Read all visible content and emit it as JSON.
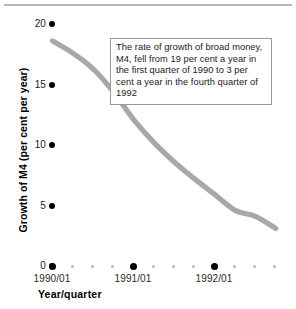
{
  "chart_data": {
    "type": "line",
    "title": "",
    "xlabel": "Year/quarter",
    "ylabel": "Growth of M4 (per cent per year)",
    "ylim": [
      0,
      20
    ],
    "yticks": [
      0,
      5,
      10,
      15,
      20
    ],
    "ytick_labels": [
      "0",
      "5",
      "10",
      "15",
      "20"
    ],
    "xlim_quarters": [
      "1990/01",
      "1992/04"
    ],
    "xtick_labels": [
      "1990/01",
      "1991/01",
      "1992/01"
    ],
    "grid": false,
    "legend": false,
    "series": [
      {
        "name": "Growth of M4",
        "color": "#a8a8a8",
        "x": [
          "1990/01",
          "1990/02",
          "1990/03",
          "1990/04",
          "1991/01",
          "1991/02",
          "1991/03",
          "1991/04",
          "1992/01",
          "1992/02",
          "1992/03",
          "1992/04"
        ],
        "values": [
          18.6,
          17.6,
          16.3,
          14.4,
          12.1,
          10.2,
          8.6,
          7.2,
          5.9,
          4.6,
          4.1,
          3.1
        ]
      }
    ],
    "annotations": [
      {
        "name": "callout",
        "text": "The rate of growth of broad money, M4, fell from 19 per cent a year in the first quarter of 1990 to 3 per cent a year in the fourth quarter of 1992"
      }
    ]
  },
  "axes": {
    "y_title": "Growth of M4 (per cent per year)",
    "x_title": "Year/quarter",
    "y_ticks": [
      {
        "label": "20",
        "value": 20
      },
      {
        "label": "15",
        "value": 15
      },
      {
        "label": "10",
        "value": 10
      },
      {
        "label": "5",
        "value": 5
      },
      {
        "label": "0",
        "value": 0
      }
    ],
    "x_ticks": [
      {
        "label": "1990/01"
      },
      {
        "label": "1991/01"
      },
      {
        "label": "1992/01"
      }
    ]
  },
  "callout": {
    "text": "The rate of growth of broad money, M4, fell from 19 per cent a year in the first quarter of 1990 to 3 per cent a year in the fourth quarter of 1992"
  },
  "colors": {
    "line": "#a8a8a8",
    "marker": "#000000",
    "minor_marker": "#b6b6b6",
    "callout_border": "#9a9a9e",
    "top_rule": "#b9b9bd",
    "text": "#1a1a1a",
    "background": "#ffffff"
  }
}
